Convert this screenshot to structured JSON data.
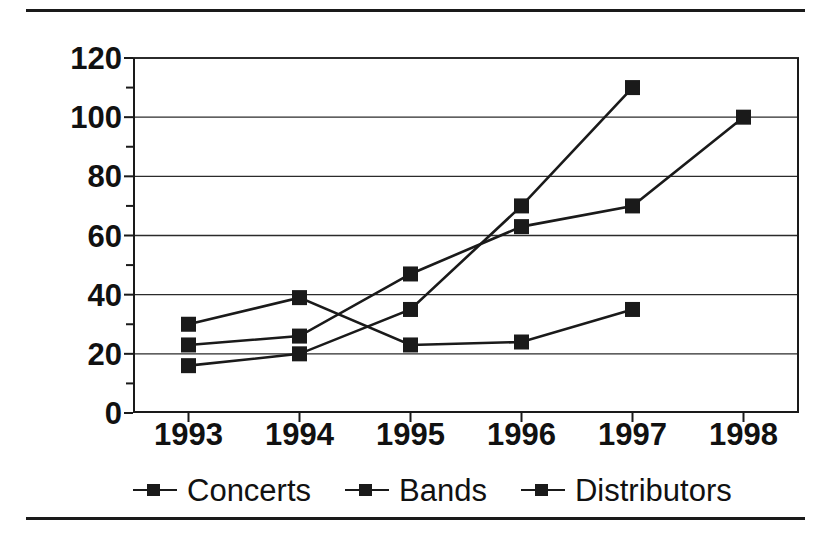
{
  "chart_data": {
    "type": "line",
    "title": "",
    "xlabel": "",
    "ylabel": "Number",
    "categories": [
      "1993",
      "1994",
      "1995",
      "1996",
      "1997",
      "1998"
    ],
    "x": [
      1993,
      1994,
      1995,
      1996,
      1997,
      1998
    ],
    "xlim": [
      1992.5,
      1998.5
    ],
    "ylim": [
      0,
      120
    ],
    "y_ticks": [
      0,
      20,
      40,
      60,
      80,
      100,
      120
    ],
    "y_tick_labels": [
      "0",
      "20",
      "40",
      "60",
      "80",
      "100",
      "120"
    ],
    "y_minor_ticks": [
      10,
      30,
      50,
      70,
      90,
      110
    ],
    "grid": "horizontal",
    "legend_position": "bottom",
    "marker": "filled-square",
    "line_color": "#1a1a1a",
    "background_color": "#ffffff",
    "series": [
      {
        "name": "Concerts",
        "x": [
          1993,
          1994,
          1995,
          1996,
          1997
        ],
        "values": [
          16,
          20,
          35,
          70,
          110
        ]
      },
      {
        "name": "Bands",
        "x": [
          1993,
          1994,
          1995,
          1996,
          1997,
          1998
        ],
        "values": [
          23,
          26,
          47,
          63,
          70,
          100
        ]
      },
      {
        "name": "Distributors",
        "x": [
          1993,
          1994,
          1995,
          1996,
          1997
        ],
        "values": [
          30,
          39,
          23,
          24,
          35
        ]
      }
    ]
  },
  "axis": {
    "y_label": "Number"
  },
  "legend": {
    "items": [
      {
        "label": "Concerts"
      },
      {
        "label": "Bands"
      },
      {
        "label": "Distributors"
      }
    ]
  }
}
